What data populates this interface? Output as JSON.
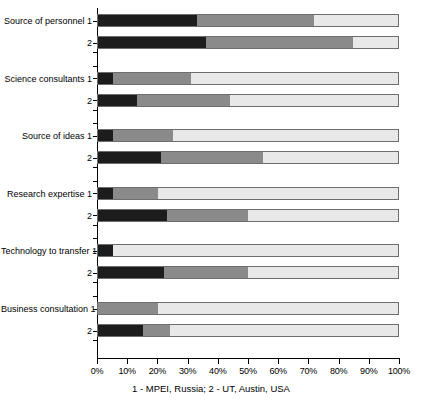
{
  "chart_data": {
    "type": "bar",
    "orientation": "horizontal",
    "stacked": true,
    "stacked_percent": true,
    "title": "",
    "subtitle": "",
    "xlabel": "1 - MPEI, Russia; 2 - UT, Austin, USA",
    "ylabel": "",
    "xlim": [
      0,
      100
    ],
    "xticks": [
      0,
      10,
      20,
      30,
      40,
      50,
      60,
      70,
      80,
      90,
      100
    ],
    "xticklabels": [
      "0%",
      "10%",
      "20%",
      "30%",
      "40%",
      "50%",
      "60%",
      "70%",
      "80%",
      "90%",
      "100%"
    ],
    "grid": false,
    "legend": "none",
    "segment_colors": [
      "#1c1c1c",
      "#8a8a8a",
      "#e8e8e8"
    ],
    "categories": [
      "Source of personnel",
      "Science consultants",
      "Source of ideas",
      "Research expertise",
      "Technology to transfer",
      "Business consultation"
    ],
    "group_labels": [
      "1",
      "2"
    ],
    "group_legend": {
      "1": "MPEI, Russia",
      "2": "UT, Austin, USA"
    },
    "rows": [
      {
        "category": "Source of personnel",
        "group": "1",
        "values": [
          33,
          39,
          28
        ]
      },
      {
        "category": "Source of personnel",
        "group": "2",
        "values": [
          36,
          49,
          15
        ]
      },
      {
        "category": "Science consultants",
        "group": "1",
        "values": [
          5,
          26,
          69
        ]
      },
      {
        "category": "Science consultants",
        "group": "2",
        "values": [
          13,
          31,
          56
        ]
      },
      {
        "category": "Source of ideas",
        "group": "1",
        "values": [
          5,
          20,
          75
        ]
      },
      {
        "category": "Source of ideas",
        "group": "2",
        "values": [
          21,
          34,
          45
        ]
      },
      {
        "category": "Research expertise",
        "group": "1",
        "values": [
          5,
          15,
          80
        ]
      },
      {
        "category": "Research expertise",
        "group": "2",
        "values": [
          23,
          27,
          50
        ]
      },
      {
        "category": "Technology to transfer",
        "group": "1",
        "values": [
          5,
          0,
          95
        ]
      },
      {
        "category": "Technology to transfer",
        "group": "2",
        "values": [
          22,
          28,
          50
        ]
      },
      {
        "category": "Business consultation",
        "group": "1",
        "values": [
          0,
          20,
          80
        ]
      },
      {
        "category": "Business consultation",
        "group": "2",
        "values": [
          15,
          9,
          76
        ]
      }
    ]
  },
  "caption": "1 - MPEI, Russia; 2 - UT, Austin, USA"
}
